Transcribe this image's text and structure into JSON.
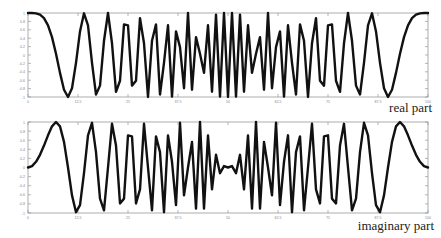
{
  "chart_data": [
    {
      "type": "line",
      "title": "",
      "caption": "real part",
      "xlabel": "",
      "ylabel": "",
      "ylim": [
        -1,
        1
      ],
      "xlim": [
        0,
        100
      ],
      "grid": false,
      "yticks": [
        1,
        0.8,
        0.6,
        0.4,
        0.2,
        0,
        -0.2,
        -0.4,
        -0.6,
        -0.8,
        -1
      ],
      "xticks": [
        0,
        12.5,
        25,
        37.5,
        50,
        62.5,
        75,
        87.5,
        100
      ],
      "x": [
        0,
        1,
        2,
        3,
        4,
        5,
        6,
        7,
        8,
        9,
        10,
        11,
        12,
        13,
        14,
        15,
        16,
        17,
        18,
        19,
        20,
        21,
        22,
        23,
        24,
        25,
        26,
        27,
        28,
        29,
        30,
        31,
        32,
        33,
        34,
        35,
        36,
        37,
        38,
        39,
        40,
        41,
        42,
        43,
        44,
        45,
        46,
        47,
        48,
        49,
        50,
        51,
        52,
        53,
        54,
        55,
        56,
        57,
        58,
        59,
        60,
        61,
        62,
        63,
        64,
        65,
        66,
        67,
        68,
        69,
        70,
        71,
        72,
        73,
        74,
        75,
        76,
        77,
        78,
        79,
        80,
        81,
        82,
        83,
        84,
        85,
        86,
        87,
        88,
        89,
        90,
        91,
        92,
        93,
        94,
        95,
        96,
        97,
        98,
        99,
        100
      ],
      "series": [
        {
          "name": "real part",
          "color": "#111111",
          "values": [
            1,
            0.9995,
            0.9921,
            0.9603,
            0.8763,
            0.7071,
            0.4258,
            0.0314,
            -0.4258,
            -0.8271,
            -1,
            -0.7902,
            -0.1874,
            0.5621,
            0.9921,
            0.7071,
            -0.1874,
            -0.9409,
            -0.729,
            0.3387,
            1,
            0.279,
            -0.8763,
            -0.6129,
            0.729,
            0.7071,
            -0.729,
            -0.6129,
            0.8763,
            0.279,
            -1,
            0.3387,
            0.729,
            -0.9409,
            -0.1874,
            0.7071,
            -0.9921,
            0.5621,
            0.1874,
            -0.7902,
            1,
            -0.8271,
            0.4258,
            0.0314,
            -0.4258,
            0.7071,
            -0.8763,
            0.9603,
            -0.9921,
            0.9995,
            -1,
            0.9995,
            -0.9921,
            0.9603,
            -0.8763,
            0.7071,
            -0.4258,
            0.0314,
            0.4258,
            -0.8271,
            1,
            -0.7902,
            0.1874,
            0.5621,
            -0.9921,
            0.7071,
            -0.1874,
            -0.9409,
            0.729,
            0.3387,
            -1,
            0.279,
            0.8763,
            -0.6129,
            -0.729,
            0.7071,
            0.729,
            -0.6129,
            -0.8763,
            0.279,
            1,
            0.3387,
            -0.729,
            -0.9409,
            -0.1874,
            0.7071,
            0.9921,
            0.5621,
            -0.1874,
            -0.7902,
            -1,
            -0.8271,
            -0.4258,
            0.0314,
            0.4258,
            0.7071,
            0.8763,
            0.9603,
            0.9921,
            0.9995,
            1
          ]
        }
      ]
    },
    {
      "type": "line",
      "title": "",
      "caption": "imaginary part",
      "xlabel": "",
      "ylabel": "",
      "ylim": [
        -1,
        1
      ],
      "xlim": [
        0,
        100
      ],
      "grid": false,
      "yticks": [
        1,
        0.8,
        0.6,
        0.4,
        0.2,
        0,
        -0.2,
        -0.4,
        -0.6,
        -0.8,
        -1
      ],
      "xticks": [
        0,
        12.5,
        25,
        37.5,
        50,
        62.5,
        75,
        87.5,
        100
      ],
      "x": [
        0,
        1,
        2,
        3,
        4,
        5,
        6,
        7,
        8,
        9,
        10,
        11,
        12,
        13,
        14,
        15,
        16,
        17,
        18,
        19,
        20,
        21,
        22,
        23,
        24,
        25,
        26,
        27,
        28,
        29,
        30,
        31,
        32,
        33,
        34,
        35,
        36,
        37,
        38,
        39,
        40,
        41,
        42,
        43,
        44,
        45,
        46,
        47,
        48,
        49,
        50,
        51,
        52,
        53,
        54,
        55,
        56,
        57,
        58,
        59,
        60,
        61,
        62,
        63,
        64,
        65,
        66,
        67,
        68,
        69,
        70,
        71,
        72,
        73,
        74,
        75,
        76,
        77,
        78,
        79,
        80,
        81,
        82,
        83,
        84,
        85,
        86,
        87,
        88,
        89,
        90,
        91,
        92,
        93,
        94,
        95,
        96,
        97,
        98,
        99,
        100
      ],
      "series": [
        {
          "name": "imaginary part",
          "color": "#111111",
          "values": [
            0,
            0.0314,
            0.1253,
            0.279,
            0.4818,
            0.7071,
            0.9048,
            0.9995,
            0.9048,
            0.5621,
            0,
            -0.6129,
            -0.9823,
            -0.8271,
            -0.1253,
            0.7071,
            0.9823,
            0.3387,
            -0.6845,
            -0.9409,
            0,
            0.9603,
            0.4818,
            -0.7902,
            -0.6845,
            0.7071,
            0.6845,
            -0.7902,
            -0.4818,
            0.9603,
            0,
            -0.9409,
            0.6845,
            0.3387,
            -0.9823,
            0.7071,
            0.1253,
            -0.8271,
            0.9823,
            -0.6129,
            0,
            0.5621,
            -0.9048,
            0.9995,
            -0.9048,
            0.7071,
            -0.4818,
            0.279,
            -0.1253,
            0.0314,
            0,
            0.0314,
            -0.1253,
            0.279,
            -0.4818,
            0.7071,
            -0.9048,
            0.9995,
            -0.9048,
            0.5621,
            0,
            -0.6129,
            0.9823,
            -0.8271,
            0.1253,
            0.7071,
            -0.9823,
            0.3387,
            0.6845,
            -0.9409,
            0,
            0.9603,
            -0.4818,
            -0.7902,
            0.6845,
            0.7071,
            -0.6845,
            -0.7902,
            0.4818,
            0.9603,
            0,
            -0.9409,
            -0.6845,
            0.3387,
            0.9823,
            0.7071,
            -0.1253,
            -0.8271,
            -0.9823,
            -0.6129,
            0,
            0.5621,
            0.9048,
            0.9995,
            0.9048,
            0.7071,
            0.4818,
            0.279,
            0.1253,
            0.0314,
            0
          ]
        }
      ]
    }
  ],
  "captions": {
    "real": "real part",
    "imag": "imaginary part"
  },
  "tick_labels": {
    "y": [
      "1",
      "0.8",
      "0.6",
      "0.4",
      "0.2",
      "0",
      "-0.2",
      "-0.4",
      "-0.6",
      "-0.8",
      "-1"
    ],
    "x": [
      "0",
      "12.5",
      "25",
      "37.5",
      "50",
      "62.5",
      "75",
      "87.5",
      "100"
    ]
  }
}
